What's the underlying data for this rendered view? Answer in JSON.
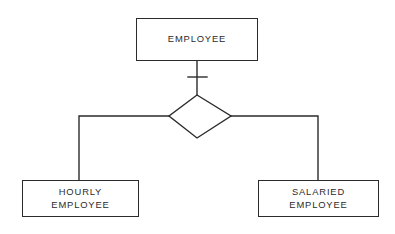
{
  "diagram": {
    "type": "er-specialization",
    "background_color": "#ffffff",
    "stroke_color": "#2b2b2b",
    "superclass": {
      "id": "employee",
      "label": "EMPLOYEE",
      "shape": "rectangle",
      "x": 136,
      "y": 18,
      "width": 122,
      "height": 43
    },
    "relationship": {
      "id": "isa",
      "label": "",
      "shape": "diamond",
      "center_x": 197,
      "center_y": 116,
      "half_width": 31,
      "half_height": 22
    },
    "participation_marker": {
      "name": "total-participation-crossbar",
      "x1": 188,
      "y1": 77,
      "x2": 207,
      "y2": 77
    },
    "subclasses": [
      {
        "id": "hourly-employee",
        "label_line_1": "HOURLY",
        "label_line_2": "EMPLOYEE",
        "shape": "rectangle",
        "x": 22,
        "y": 180,
        "width": 117,
        "height": 37
      },
      {
        "id": "salaried-employee",
        "label_line_1": "SALARIED",
        "label_line_2": "EMPLOYEE",
        "shape": "rectangle",
        "x": 258,
        "y": 180,
        "width": 121,
        "height": 37
      }
    ],
    "connectors": [
      {
        "id": "employee-to-isa",
        "path": "M 197 61 L 197 95"
      },
      {
        "id": "isa-to-hourly",
        "path": "M 169 116 L 79 116 L 79 180"
      },
      {
        "id": "isa-to-salaried",
        "path": "M 231 116 L 318 116 L 318 180"
      }
    ]
  }
}
